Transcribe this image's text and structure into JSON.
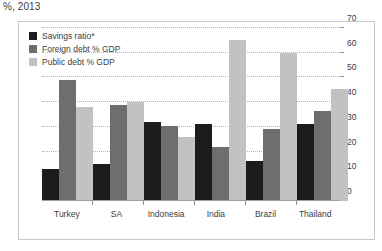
{
  "chart_title": "%, 2013",
  "chart_data": {
    "type": "bar",
    "title": "%, 2013",
    "xlabel": "",
    "ylabel": "",
    "ylim": [
      0,
      70
    ],
    "yticks": [
      0,
      10,
      20,
      30,
      40,
      50,
      60,
      70
    ],
    "ytick_labels": [
      "0",
      "10",
      "20",
      "30",
      "40",
      "50",
      "60",
      "70"
    ],
    "grid": true,
    "legend_position": "top-left",
    "categories": [
      "Turkey",
      "SA",
      "Indonesia",
      "India",
      "Brazil",
      "Thailand"
    ],
    "series": [
      {
        "name": "Savings ratio*",
        "color": "#1c1c1c",
        "values": [
          13,
          15,
          32,
          31,
          16,
          31
        ]
      },
      {
        "name": "Foreign debt % GDP",
        "color": "#6e6e6e",
        "values": [
          49,
          39,
          30.5,
          22,
          29,
          36.5
        ]
      },
      {
        "name": "Public debt % GDP",
        "color": "#c2c2c2",
        "values": [
          38,
          40,
          26,
          65,
          60,
          45.5
        ]
      }
    ]
  },
  "colors": {
    "savings_ratio": "#1c1c1c",
    "foreign_debt": "#6e6e6e",
    "public_debt": "#c2c2c2",
    "gridline": "#b4b4b4",
    "axis": "#8e8e8e",
    "frame": "#c9c9c9",
    "text": "#3d3d3d"
  }
}
